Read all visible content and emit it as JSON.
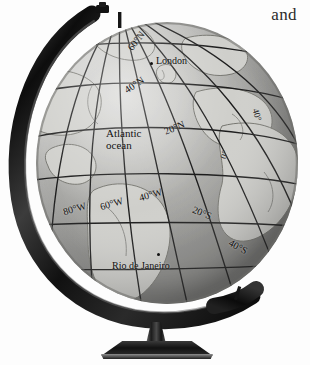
{
  "figure": {
    "surrounding_text": {
      "fragment": "and"
    }
  },
  "globe": {
    "cities": [
      {
        "name": "London",
        "id": "london"
      },
      {
        "name": "Rio de Janeiro",
        "id": "rio"
      }
    ],
    "ocean_labels": [
      {
        "line1": "Atlantic",
        "line2": "ocean"
      }
    ],
    "parallels": [
      {
        "id": "60n",
        "label": "60°N"
      },
      {
        "id": "40n",
        "label": "40°N"
      },
      {
        "id": "20n",
        "label": "20°N"
      },
      {
        "id": "20s",
        "label": "20°S"
      },
      {
        "id": "40s",
        "label": "40°S"
      }
    ],
    "meridians": [
      {
        "id": "80w",
        "label": "80°W"
      },
      {
        "id": "60w",
        "label": "60°W"
      },
      {
        "id": "40w",
        "label": "40°W"
      },
      {
        "id": "0",
        "label": "0°"
      },
      {
        "id": "40e",
        "label": "40°"
      }
    ]
  },
  "colors": {
    "sphere_light": "#d8d8d6",
    "sphere_mid": "#b4b4b1",
    "sphere_dark": "#8d8d8a",
    "graticule": "#1a1a1a",
    "coastline": "#6e6e6b",
    "ring_dark": "#101010",
    "ring_light": "#8a8a8a",
    "label_text": "#111111",
    "page_background": "#ffffff"
  }
}
